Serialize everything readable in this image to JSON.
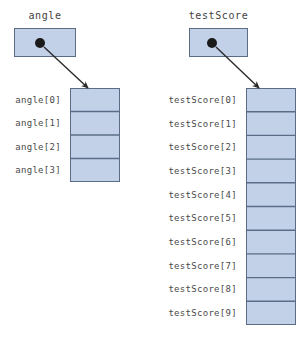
{
  "figure": {
    "background_color": "#ffffff",
    "cell_fill_color": "#c3d1e8",
    "cell_border_color": "#5b6c87",
    "pointer_dot_color": "#1a1a1a",
    "arrow_color": "#2b2b2b",
    "text_color": "#444444"
  },
  "structures": [
    {
      "id": "angle",
      "variable_label": "angle",
      "pointer_box": {
        "x": 14,
        "y": 28,
        "width": 62,
        "height": 29
      },
      "pointer_dot": {
        "cx": 40,
        "cy": 43,
        "r": 5
      },
      "arrow": {
        "x1": 44,
        "y1": 47,
        "x2": 88,
        "y2": 88
      },
      "array_box": {
        "x": 70,
        "y": 88,
        "width": 50,
        "height": 94
      },
      "cell_count": 4,
      "cells": [
        {
          "label": "angle[0]",
          "value": ""
        },
        {
          "label": "angle[1]",
          "value": ""
        },
        {
          "label": "angle[2]",
          "value": ""
        },
        {
          "label": "angle[3]",
          "value": ""
        }
      ]
    },
    {
      "id": "testScore",
      "variable_label": "testScore",
      "pointer_box": {
        "x": 189,
        "y": 28,
        "width": 59,
        "height": 29
      },
      "pointer_dot": {
        "cx": 212,
        "cy": 43,
        "r": 5
      },
      "arrow": {
        "x1": 216,
        "y1": 47,
        "x2": 259,
        "y2": 88
      },
      "array_box": {
        "x": 246,
        "y": 88,
        "width": 50,
        "height": 237
      },
      "cell_count": 10,
      "cells": [
        {
          "label": "testScore[0]",
          "value": ""
        },
        {
          "label": "testScore[1]",
          "value": ""
        },
        {
          "label": "testScore[2]",
          "value": ""
        },
        {
          "label": "testScore[3]",
          "value": ""
        },
        {
          "label": "testScore[4]",
          "value": ""
        },
        {
          "label": "testScore[5]",
          "value": ""
        },
        {
          "label": "testScore[6]",
          "value": ""
        },
        {
          "label": "testScore[7]",
          "value": ""
        },
        {
          "label": "testScore[8]",
          "value": ""
        },
        {
          "label": "testScore[9]",
          "value": ""
        }
      ]
    }
  ]
}
